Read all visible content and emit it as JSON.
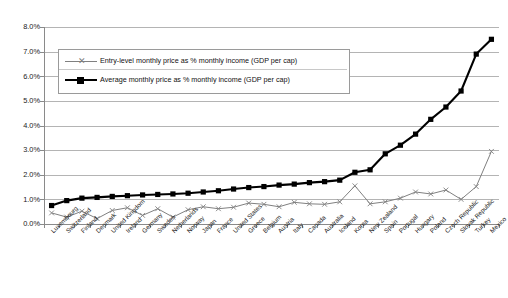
{
  "chart_data": {
    "type": "line",
    "title": "",
    "xlabel": "",
    "ylabel": "",
    "ylim": [
      0.0,
      8.0
    ],
    "ytick_labels": [
      "0.0%",
      "1.0%",
      "2.0%",
      "3.0%",
      "4.0%",
      "5.0%",
      "6.0%",
      "7.0%",
      "8.0%"
    ],
    "yticks": [
      0.0,
      1.0,
      2.0,
      3.0,
      4.0,
      5.0,
      6.0,
      7.0,
      8.0
    ],
    "grid": true,
    "legend_position": "upper-left-inside",
    "categories": [
      "Luxembourg",
      "Switzerland",
      "Finland",
      "Denmark",
      "United Kingdom",
      "Ireland",
      "Germany",
      "Sweden",
      "Netherlands",
      "Norway",
      "Japan",
      "France",
      "United States",
      "Greece",
      "Belgium",
      "Austria",
      "Italy",
      "Canada",
      "Australia",
      "Iceland",
      "Korea",
      "New Zealand",
      "Spain",
      "Portugal",
      "Hungary",
      "Poland",
      "Czech Republic",
      "Slovak Republic",
      "Turkey",
      "Mexico"
    ],
    "series": [
      {
        "name": "Entry-level monthly price as % monthly income (GDP per cap)",
        "marker": "x",
        "color": "#808080",
        "values": [
          0.45,
          0.28,
          0.52,
          0.22,
          0.55,
          0.66,
          0.35,
          0.62,
          0.28,
          0.58,
          0.7,
          0.62,
          0.68,
          0.85,
          0.8,
          0.7,
          0.88,
          0.82,
          0.8,
          0.9,
          1.55,
          0.82,
          0.9,
          1.05,
          1.3,
          1.22,
          1.38,
          1.0,
          1.52,
          2.95
        ]
      },
      {
        "name": "Average monthly price as % monthly income (GDP per cap)",
        "marker": "square",
        "color": "#000000",
        "values": [
          0.75,
          0.95,
          1.05,
          1.08,
          1.12,
          1.15,
          1.18,
          1.2,
          1.22,
          1.25,
          1.3,
          1.35,
          1.42,
          1.48,
          1.52,
          1.58,
          1.62,
          1.68,
          1.72,
          1.78,
          2.1,
          2.2,
          2.85,
          3.2,
          3.65,
          4.25,
          4.75,
          5.4,
          6.9,
          7.5
        ]
      }
    ]
  },
  "legend": {
    "entries": [
      {
        "label": "Entry-level monthly price as % monthly income (GDP per cap)"
      },
      {
        "label": "Average monthly price as % monthly income (GDP per cap)"
      }
    ]
  }
}
